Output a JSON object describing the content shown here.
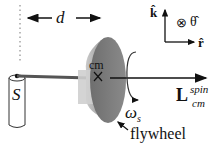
{
  "diagram": {
    "labels": {
      "distance": "d",
      "pivot": "S",
      "center_of_mass": "cm",
      "angular_velocity": "ω",
      "angular_velocity_sub": "s",
      "angular_momentum": "L",
      "angular_momentum_sup": "spin",
      "angular_momentum_sub": "cm",
      "flywheel": "flywheel",
      "unit_k": "k̂",
      "unit_theta": "θ̂",
      "unit_r": "r̂",
      "into_page_symbol": "⊗"
    },
    "colors": {
      "disk_face": "#7a7a7a",
      "disk_rim": "#b8b8b8",
      "axle": "#555555",
      "line": "#111111"
    }
  }
}
